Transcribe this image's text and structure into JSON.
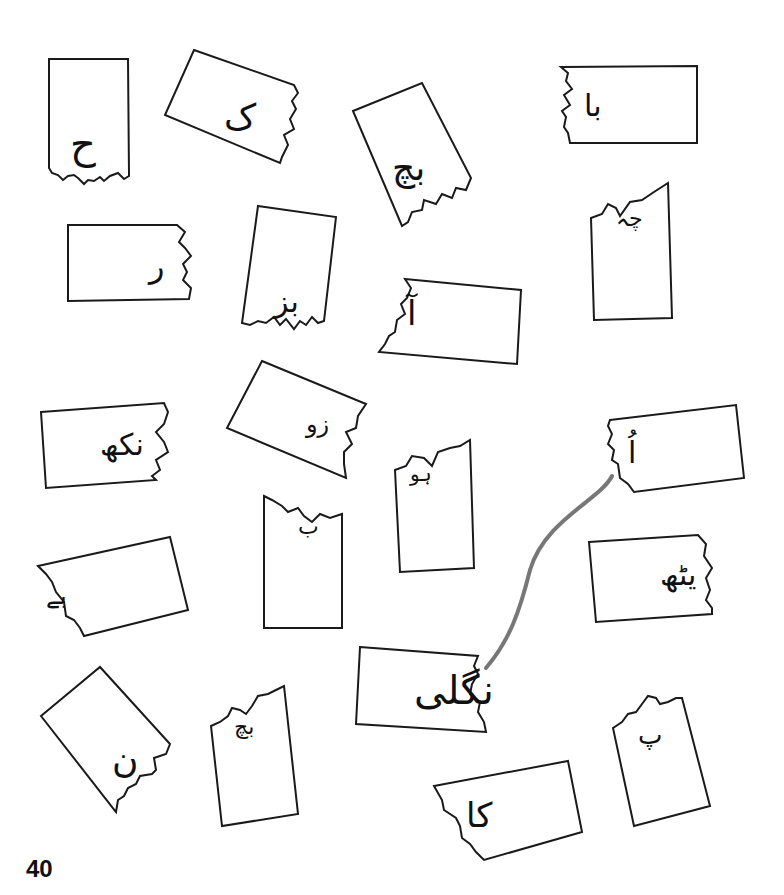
{
  "page": {
    "number": "40",
    "background": "#ffffff",
    "line_color": "#1a1a1a",
    "connector_color": "#777777"
  },
  "pieces": [
    {
      "id": "p1",
      "text": "ح",
      "torn_side": "bottom"
    },
    {
      "id": "p2",
      "text": "ک",
      "torn_side": "right"
    },
    {
      "id": "p3",
      "text": "بچ",
      "torn_side": "bottom-right"
    },
    {
      "id": "p4",
      "text": "با",
      "torn_side": "left"
    },
    {
      "id": "p5",
      "text": "ر",
      "torn_side": "right"
    },
    {
      "id": "p6",
      "text": "بز",
      "torn_side": "bottom"
    },
    {
      "id": "p7",
      "text": "آ",
      "torn_side": "left"
    },
    {
      "id": "p8",
      "text": "چہ",
      "torn_side": "top"
    },
    {
      "id": "p9",
      "text": "نکھ",
      "torn_side": "right"
    },
    {
      "id": "p10",
      "text": "زو",
      "torn_side": "right"
    },
    {
      "id": "p11",
      "text": "ہو",
      "torn_side": "top"
    },
    {
      "id": "p12",
      "text": "اُ",
      "torn_side": "left"
    },
    {
      "id": "p13",
      "text": "بے",
      "torn_side": "top"
    },
    {
      "id": "p14",
      "text": "ب",
      "torn_side": "left"
    },
    {
      "id": "p15",
      "text": "یٹھ",
      "torn_side": "right"
    },
    {
      "id": "p16",
      "text": "نگلی",
      "torn_side": "right"
    },
    {
      "id": "p17",
      "text": "ن",
      "torn_side": "bottom-right"
    },
    {
      "id": "p18",
      "text": "بچ",
      "torn_side": "top"
    },
    {
      "id": "p19",
      "text": "پ",
      "torn_side": "top"
    },
    {
      "id": "p20",
      "text": "کا",
      "torn_side": "left"
    }
  ],
  "example_match": {
    "from": "نگلی",
    "to": "اُ",
    "word": "اُنگلی"
  }
}
